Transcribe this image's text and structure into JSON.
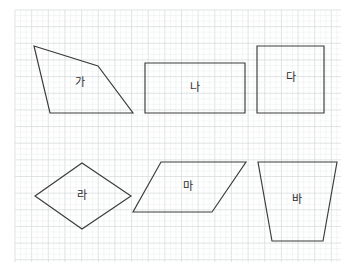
{
  "page": {
    "width": 354,
    "height": 271,
    "background_color": "#ffffff"
  },
  "grid": {
    "name": "dotted-grid-paper",
    "x": 15,
    "y": 10,
    "width": 326,
    "height": 252,
    "minor_spacing": 5.55,
    "major_spacing": 16.65,
    "minor_color": "#e8ecec",
    "major_color": "#d2d9d9"
  },
  "style": {
    "shape_stroke_color": "#3a3a3a",
    "shape_stroke_width": 1.15,
    "shape_fill": "none",
    "label_color": "#2b2b2b",
    "label_font_size": 11
  },
  "shapes": [
    {
      "id": "shape-ga",
      "label": "가",
      "type": "quadrilateral",
      "points": "34,46 98,66 133,113 50,113",
      "label_x": 80,
      "label_y": 83
    },
    {
      "id": "shape-na",
      "label": "나",
      "type": "rectangle",
      "points": "145,63 245,63 245,113 145,113",
      "label_x": 195,
      "label_y": 88
    },
    {
      "id": "shape-da",
      "label": "다",
      "type": "square",
      "points": "257,46 324,46 324,113 257,113",
      "label_x": 291,
      "label_y": 78
    },
    {
      "id": "shape-ra",
      "label": "라",
      "type": "rhombus",
      "points": "35,196 82,163 131,196 82,229",
      "label_x": 82,
      "label_y": 196
    },
    {
      "id": "shape-ma",
      "label": "마",
      "type": "parallelogram",
      "points": "161,162 246,162 212,212 133,212",
      "label_x": 188,
      "label_y": 187
    },
    {
      "id": "shape-ba",
      "label": "바",
      "type": "trapezoid",
      "points": "258,162 337,162 323,241 272,241",
      "label_x": 297,
      "label_y": 200
    }
  ]
}
